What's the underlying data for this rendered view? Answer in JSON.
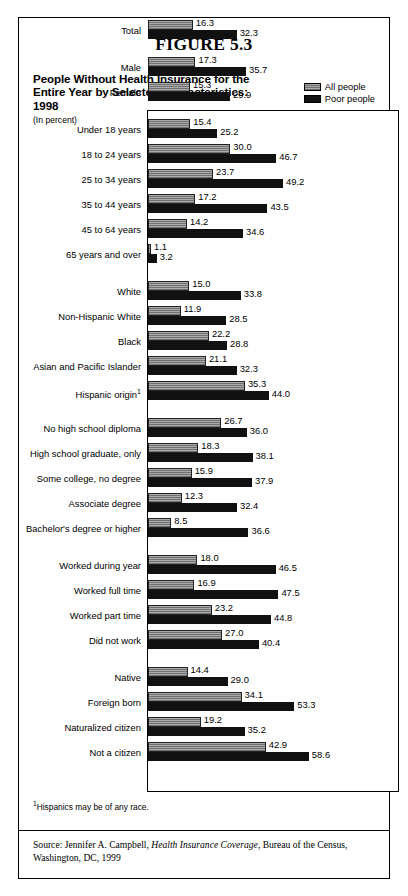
{
  "figure": {
    "number": "FIGURE 5.3",
    "title_line1": "People Without Health Insurance for the",
    "title_line2": "Entire Year by Selected Characteristics:  1998",
    "units": "(In percent)",
    "footnote_marker": "1",
    "footnote": "Hispanics may be of any race.",
    "source_prefix": "Source: Jennifer A. Campbell, ",
    "source_italic": "Health Insurance Coverage",
    "source_suffix": ", Bureau of the Census, Washington, DC, 1999"
  },
  "legend": {
    "series1": "All people",
    "series2": "Poor people",
    "color1": "#8d8d8d",
    "color2": "#111111"
  },
  "chart_data": {
    "type": "bar",
    "orientation": "horizontal",
    "title": "People Without Health Insurance for the Entire Year by Selected Characteristics:  1998",
    "xlabel": "Percent",
    "ylabel": "",
    "xlim": [
      0,
      60
    ],
    "grid": false,
    "legend_position": "top-right",
    "series": [
      {
        "name": "All people",
        "color": "#8d8d8d",
        "values": [
          16.3,
          17.3,
          15.3,
          15.4,
          30.0,
          23.7,
          17.2,
          14.2,
          1.1,
          15.0,
          11.9,
          22.2,
          21.1,
          35.3,
          26.7,
          18.3,
          15.9,
          12.3,
          8.5,
          18.0,
          16.9,
          23.2,
          27.0,
          14.4,
          34.1,
          19.2,
          42.9
        ]
      },
      {
        "name": "Poor people",
        "color": "#111111",
        "values": [
          32.3,
          35.7,
          29.9,
          25.2,
          46.7,
          49.2,
          43.5,
          34.6,
          3.2,
          33.8,
          28.5,
          28.8,
          32.3,
          44.0,
          36.0,
          38.1,
          37.9,
          32.4,
          36.6,
          46.5,
          47.5,
          44.8,
          40.4,
          29.0,
          53.3,
          35.2,
          58.6
        ]
      }
    ],
    "categories": [
      "Total",
      "Male",
      "Female",
      "Under 18 years",
      "18 to 24 years",
      "25 to 34 years",
      "35 to 44 years",
      "45 to 64 years",
      "65 years and over",
      "White",
      "Non-Hispanic White",
      "Black",
      "Asian and Pacific Islander",
      "Hispanic origin",
      "No high school diploma",
      "High school graduate, only",
      "Some college, no degree",
      "Associate degree",
      "Bachelor's degree or higher",
      "Worked during year",
      "Worked full time",
      "Worked part time",
      "Did not work",
      "Native",
      "Foreign born",
      "Naturalized citizen",
      "Not a citizen"
    ],
    "groups": [
      {
        "rows": [
          {
            "label": "Total",
            "all": 16.3,
            "poor": 32.3
          }
        ]
      },
      {
        "rows": [
          {
            "label": "Male",
            "all": 17.3,
            "poor": 35.7
          },
          {
            "label": "Female",
            "all": 15.3,
            "poor": 29.9
          }
        ]
      },
      {
        "rows": [
          {
            "label": "Under 18 years",
            "all": 15.4,
            "poor": 25.2
          },
          {
            "label": "18 to 24 years",
            "all": 30.0,
            "poor": 46.7
          },
          {
            "label": "25 to 34 years",
            "all": 23.7,
            "poor": 49.2
          },
          {
            "label": "35 to 44 years",
            "all": 17.2,
            "poor": 43.5
          },
          {
            "label": "45 to 64 years",
            "all": 14.2,
            "poor": 34.6
          },
          {
            "label": "65 years and over",
            "all": 1.1,
            "poor": 3.2
          }
        ]
      },
      {
        "rows": [
          {
            "label": "White",
            "all": 15.0,
            "poor": 33.8
          },
          {
            "label": "Non-Hispanic White",
            "all": 11.9,
            "poor": 28.5
          },
          {
            "label": "Black",
            "all": 22.2,
            "poor": 28.8
          },
          {
            "label": "Asian and Pacific Islander",
            "all": 21.1,
            "poor": 32.3
          },
          {
            "label": "Hispanic origin",
            "sup": "1",
            "all": 35.3,
            "poor": 44.0
          }
        ]
      },
      {
        "rows": [
          {
            "label": "No high school diploma",
            "all": 26.7,
            "poor": 36.0
          },
          {
            "label": "High school graduate, only",
            "all": 18.3,
            "poor": 38.1
          },
          {
            "label": "Some college, no degree",
            "all": 15.9,
            "poor": 37.9
          },
          {
            "label": "Associate degree",
            "all": 12.3,
            "poor": 32.4
          },
          {
            "label": "Bachelor's degree or higher",
            "all": 8.5,
            "poor": 36.6
          }
        ]
      },
      {
        "rows": [
          {
            "label": "Worked during year",
            "all": 18.0,
            "poor": 46.5
          },
          {
            "label": "Worked full time",
            "all": 16.9,
            "poor": 47.5
          },
          {
            "label": "Worked part time",
            "all": 23.2,
            "poor": 44.8
          },
          {
            "label": "Did not work",
            "all": 27.0,
            "poor": 40.4
          }
        ]
      },
      {
        "rows": [
          {
            "label": "Native",
            "all": 14.4,
            "poor": 29.0
          },
          {
            "label": "Foreign born",
            "all": 34.1,
            "poor": 53.3
          },
          {
            "label": "Naturalized citizen",
            "all": 19.2,
            "poor": 35.2
          },
          {
            "label": "Not a citizen",
            "all": 42.9,
            "poor": 58.6
          }
        ]
      }
    ]
  }
}
